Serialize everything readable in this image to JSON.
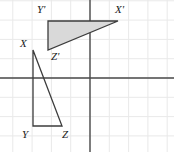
{
  "figure": {
    "width": 174,
    "height": 152,
    "background_color": "#ffffff",
    "grid": {
      "visible": true,
      "spacing_px": 19.3,
      "line_color": "#e9e9e9",
      "line_width": 1
    },
    "axes": {
      "visible": true,
      "color": "#4a4a4a",
      "line_width": 1.4,
      "origin_px": {
        "x": 90,
        "y": 78
      },
      "x_axis_y_px": 78,
      "y_axis_x_px": 90
    }
  },
  "chart_data": {
    "type": "scatter",
    "title": "",
    "xlabel": "",
    "ylabel": "",
    "grid": true,
    "legend": false,
    "xlim": [
      -4.7,
      4.4
    ],
    "ylim": [
      -3.9,
      4.1
    ],
    "shapes": [
      {
        "name": "triangle-xyz",
        "label": "XYZ",
        "kind": "triangle",
        "filled": false,
        "fill_color": "none",
        "stroke_color": "#3c3c3c",
        "stroke_width": 1.3,
        "vertices": [
          {
            "label": "X",
            "x": -3.0,
            "y": 1.5,
            "px": 33,
            "py": 50
          },
          {
            "label": "Y",
            "x": -3.0,
            "y": -2.5,
            "px": 33,
            "py": 126
          },
          {
            "label": "Z",
            "x": -1.5,
            "y": -2.5,
            "px": 62,
            "py": 126
          }
        ]
      },
      {
        "name": "triangle-x-prime-y-prime-z-prime",
        "label": "X'Y'Z'",
        "kind": "triangle",
        "filled": true,
        "fill_color": "#d9d9d9",
        "stroke_color": "#3c3c3c",
        "stroke_width": 1.3,
        "vertices": [
          {
            "label": "Y'",
            "x": -2.2,
            "y": 3.0,
            "px": 48,
            "py": 21
          },
          {
            "label": "X'",
            "x": 1.5,
            "y": 3.0,
            "px": 118,
            "py": 21
          },
          {
            "label": "Z'",
            "x": -2.2,
            "y": 1.5,
            "px": 48,
            "py": 50
          }
        ]
      }
    ]
  },
  "labels": [
    {
      "name": "label-y-prime",
      "text": "Y'",
      "left": 37,
      "top": 4
    },
    {
      "name": "label-x-prime",
      "text": "X'",
      "left": 115,
      "top": 4
    },
    {
      "name": "label-z-prime",
      "text": "Z'",
      "left": 51,
      "top": 51
    },
    {
      "name": "label-x",
      "text": "X",
      "left": 20,
      "top": 38
    },
    {
      "name": "label-y",
      "text": "Y",
      "left": 22,
      "top": 129
    },
    {
      "name": "label-z",
      "text": "Z",
      "left": 62,
      "top": 129
    }
  ]
}
